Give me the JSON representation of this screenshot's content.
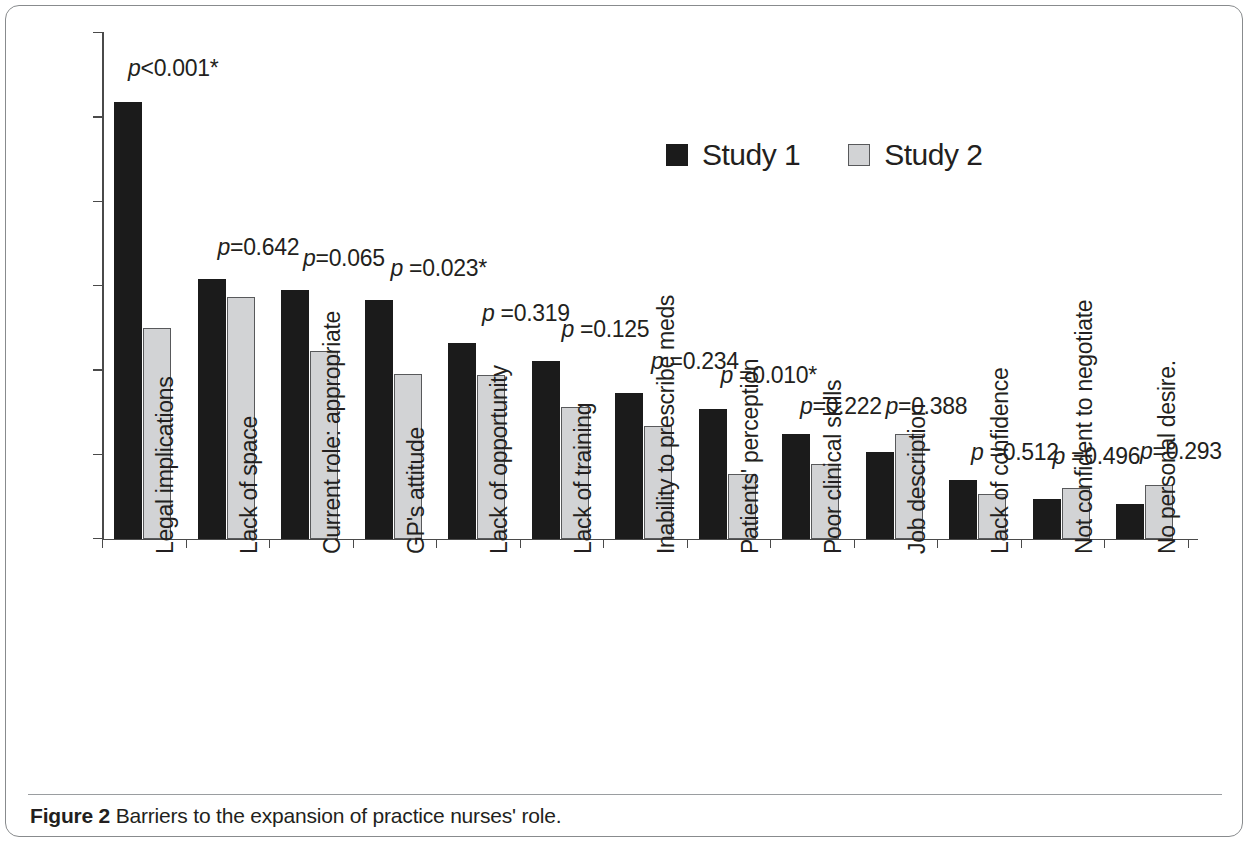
{
  "figure": {
    "caption_label": "Figure 2",
    "caption_text": "Barriers to the expansion of practice nurses' role."
  },
  "chart_data": {
    "type": "bar",
    "title": "",
    "subtitle": "",
    "xlabel": "",
    "ylabel": "",
    "ylim": [
      0,
      60
    ],
    "ytick_values": [
      0,
      10,
      20,
      30,
      40,
      50,
      60
    ],
    "ytick_labels": [
      "0%",
      "10%",
      "20%",
      "30%",
      "40%",
      "50%",
      "60%"
    ],
    "grid": false,
    "legend_position": "top-center",
    "value_unit": "percent",
    "categories": [
      "Legal implications",
      "Lack of space",
      "Current role: appropriate",
      "GP's attitude",
      "Lack of opportunity",
      "Lack of training",
      "Inability to prescribe meds",
      "Patients' perception",
      "Poor clinical skills",
      "Job description",
      "Lack of confidence",
      "Not confident to negotiate",
      "No personal desire."
    ],
    "series": [
      {
        "name": "Study 1",
        "color": "#1b1b1b",
        "values": [
          51.8,
          30.8,
          29.5,
          28.3,
          23.3,
          21.1,
          17.3,
          15.4,
          12.5,
          10.3,
          7.0,
          4.7,
          4.2
        ]
      },
      {
        "name": "Study 2",
        "color": "#d2d3d5",
        "values": [
          25.0,
          28.7,
          22.3,
          19.6,
          19.5,
          15.6,
          13.4,
          7.7,
          8.9,
          12.5,
          5.3,
          6.0,
          6.4
        ]
      }
    ],
    "annotations": [
      "p<0.001*",
      "p=0.642",
      "p=0.065",
      "p =0.023*",
      "p =0.319",
      "p =0.125",
      "p =0.234",
      "p =0.010*",
      "p=0.222",
      "p=0.388",
      "p =0.512",
      "p =0.496",
      "p=0.293"
    ]
  }
}
